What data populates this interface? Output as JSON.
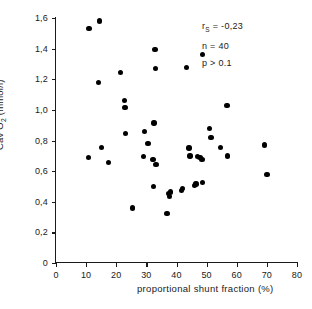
{
  "chart_data": {
    "type": "scatter",
    "title": "",
    "xlabel": "proportional shunt fraction (%)",
    "ylabel": "Cav O2 (mmol/l)",
    "xlim": [
      0,
      80
    ],
    "ylim": [
      0,
      1.6
    ],
    "xticks": [
      0,
      10,
      20,
      30,
      40,
      50,
      60,
      70,
      80
    ],
    "yticks": [
      0,
      0.2,
      0.4,
      0.6,
      0.8,
      1.0,
      1.2,
      1.4,
      1.6
    ],
    "xtick_labels": [
      "0",
      "10",
      "20",
      "30",
      "40",
      "50",
      "60",
      "70",
      "80"
    ],
    "ytick_labels": [
      "0",
      "0,2",
      "0,4",
      "0,6",
      "0,8",
      "1,0",
      "1,2",
      "1,4",
      "1,6"
    ],
    "grid": false,
    "legend": "none",
    "marker": "filled-circle",
    "marker_color": "#000000",
    "n_points": 40,
    "points": [
      [
        11.0,
        1.53
      ],
      [
        14.5,
        1.58
      ],
      [
        14.2,
        1.18
      ],
      [
        10.8,
        0.69
      ],
      [
        15.0,
        0.755
      ],
      [
        17.5,
        0.655
      ],
      [
        21.5,
        1.245
      ],
      [
        22.8,
        1.06
      ],
      [
        22.9,
        1.015
      ],
      [
        23.0,
        0.845
      ],
      [
        25.4,
        0.36
      ],
      [
        29.3,
        0.86
      ],
      [
        29.0,
        0.695
      ],
      [
        30.6,
        0.78
      ],
      [
        32.2,
        0.675
      ],
      [
        32.8,
        1.395
      ],
      [
        33.0,
        1.27
      ],
      [
        32.5,
        0.915
      ],
      [
        33.2,
        0.645
      ],
      [
        32.4,
        0.5
      ],
      [
        36.9,
        0.325
      ],
      [
        37.4,
        0.455
      ],
      [
        37.6,
        0.435
      ],
      [
        38.0,
        0.465
      ],
      [
        41.6,
        0.475
      ],
      [
        42.0,
        0.485
      ],
      [
        43.4,
        1.275
      ],
      [
        44.2,
        0.75
      ],
      [
        44.5,
        0.7
      ],
      [
        45.9,
        0.505
      ],
      [
        46.5,
        0.515
      ],
      [
        47.0,
        0.695
      ],
      [
        47.8,
        0.69
      ],
      [
        48.4,
        0.675
      ],
      [
        48.6,
        1.36
      ],
      [
        48.7,
        0.525
      ],
      [
        51.0,
        0.88
      ],
      [
        51.4,
        0.82
      ],
      [
        54.6,
        0.755
      ],
      [
        56.8,
        1.03
      ],
      [
        57.0,
        0.7
      ],
      [
        69.3,
        0.77
      ],
      [
        70.0,
        0.58
      ]
    ],
    "annotations": {
      "r_spearman": "r",
      "r_subscript": "S",
      "r_value": " = -0,23",
      "n": "n = 40",
      "p": "p > 0.1"
    }
  }
}
